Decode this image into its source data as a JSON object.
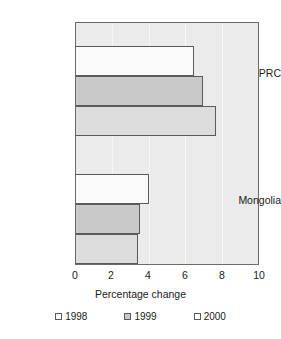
{
  "chart_data": {
    "type": "bar",
    "orientation": "horizontal",
    "title": "",
    "xlabel": "Percentage change",
    "ylabel": "",
    "categories": [
      "PRC",
      "Mongolia"
    ],
    "series": [
      {
        "name": "1998",
        "values": [
          6.5,
          4.0
        ],
        "color": "#fafafa"
      },
      {
        "name": "1999",
        "values": [
          7.0,
          3.5
        ],
        "color": "#c9c9c9"
      },
      {
        "name": "2000",
        "values": [
          7.7,
          3.4
        ],
        "color": "#dcdcdc"
      }
    ],
    "xlim": [
      0,
      10
    ],
    "xticks": [
      0,
      2,
      4,
      6,
      8,
      10
    ],
    "xtick_labels": [
      "0",
      "2",
      "4",
      "6",
      "8",
      "10"
    ],
    "grid": true,
    "grid_axis": "x",
    "legend_position": "bottom",
    "plot_background": "#ebebeb",
    "bar_border_color": "#5a5a5a",
    "axis_color": "#6b6b6b"
  },
  "legend": {
    "items": [
      {
        "label": "1998",
        "swatch": "legend-swatch-1998"
      },
      {
        "label": "1999",
        "swatch": "legend-swatch-1999"
      },
      {
        "label": "2000",
        "swatch": "legend-swatch-2000"
      }
    ]
  },
  "axis": {
    "title": "Percentage change",
    "ticks": [
      "0",
      "2",
      "4",
      "6",
      "8",
      "10"
    ]
  },
  "categories": {
    "prc": "PRC",
    "mongolia": "Mongolia"
  }
}
